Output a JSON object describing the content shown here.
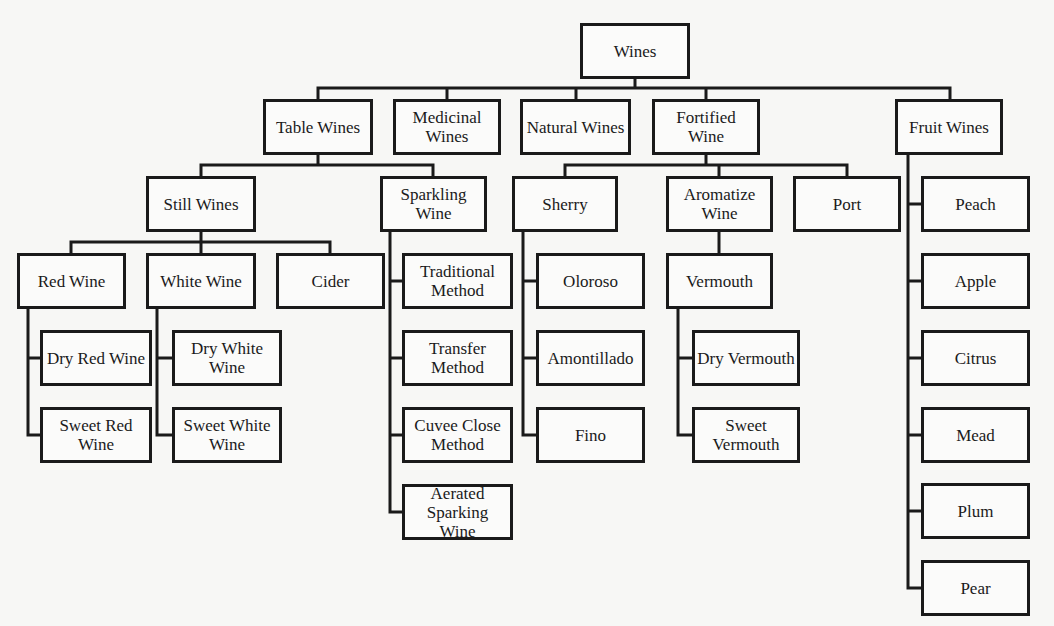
{
  "diagram": {
    "title": "Wines",
    "nodes": {
      "wines": {
        "label": "Wines",
        "x": 580,
        "y": 23,
        "w": 110,
        "h": 56
      },
      "table_wines": {
        "label": "Table Wines",
        "x": 263,
        "y": 99,
        "w": 110,
        "h": 56
      },
      "medicinal_wines": {
        "label": "Medicinal\nWines",
        "x": 393,
        "y": 99,
        "w": 108,
        "h": 56
      },
      "natural_wines": {
        "label": "Natural Wines",
        "x": 520,
        "y": 99,
        "w": 111,
        "h": 56
      },
      "fortified_wine": {
        "label": "Fortified\nWine",
        "x": 652,
        "y": 99,
        "w": 108,
        "h": 56
      },
      "fruit_wines": {
        "label": "Fruit Wines",
        "x": 895,
        "y": 99,
        "w": 108,
        "h": 56
      },
      "still_wines": {
        "label": "Still Wines",
        "x": 146,
        "y": 176,
        "w": 110,
        "h": 56
      },
      "sparkling_wine": {
        "label": "Sparkling\nWine",
        "x": 380,
        "y": 176,
        "w": 107,
        "h": 56
      },
      "sherry": {
        "label": "Sherry",
        "x": 512,
        "y": 176,
        "w": 106,
        "h": 56
      },
      "aromatize_wine": {
        "label": "Aromatize\nWine",
        "x": 666,
        "y": 176,
        "w": 107,
        "h": 56
      },
      "port": {
        "label": "Port",
        "x": 793,
        "y": 176,
        "w": 108,
        "h": 56
      },
      "peach": {
        "label": "Peach",
        "x": 921,
        "y": 176,
        "w": 109,
        "h": 56
      },
      "red_wine": {
        "label": "Red Wine",
        "x": 17,
        "y": 253,
        "w": 109,
        "h": 56
      },
      "white_wine": {
        "label": "White Wine",
        "x": 146,
        "y": 253,
        "w": 110,
        "h": 56
      },
      "cider": {
        "label": "Cider",
        "x": 276,
        "y": 253,
        "w": 109,
        "h": 56
      },
      "traditional_method": {
        "label": "Traditional\nMethod",
        "x": 402,
        "y": 253,
        "w": 111,
        "h": 56
      },
      "oloroso": {
        "label": "Oloroso",
        "x": 536,
        "y": 253,
        "w": 109,
        "h": 56
      },
      "vermouth": {
        "label": "Vermouth",
        "x": 666,
        "y": 253,
        "w": 107,
        "h": 56
      },
      "apple": {
        "label": "Apple",
        "x": 921,
        "y": 253,
        "w": 109,
        "h": 56
      },
      "dry_red_wine": {
        "label": "Dry Red Wine",
        "x": 40,
        "y": 330,
        "w": 112,
        "h": 56
      },
      "dry_white_wine": {
        "label": "Dry White\nWine",
        "x": 172,
        "y": 330,
        "w": 110,
        "h": 56
      },
      "transfer_method": {
        "label": "Transfer\nMethod",
        "x": 402,
        "y": 330,
        "w": 111,
        "h": 56
      },
      "amontillado": {
        "label": "Amontillado",
        "x": 536,
        "y": 330,
        "w": 109,
        "h": 56
      },
      "dry_vermouth": {
        "label": "Dry Vermouth",
        "x": 692,
        "y": 330,
        "w": 108,
        "h": 56
      },
      "citrus": {
        "label": "Citrus",
        "x": 921,
        "y": 330,
        "w": 109,
        "h": 56
      },
      "sweet_red_wine": {
        "label": "Sweet Red\nWine",
        "x": 40,
        "y": 407,
        "w": 112,
        "h": 56
      },
      "sweet_white_wine": {
        "label": "Sweet White\nWine",
        "x": 172,
        "y": 407,
        "w": 110,
        "h": 56
      },
      "cuvee_close_method": {
        "label": "Cuvee Close\nMethod",
        "x": 402,
        "y": 407,
        "w": 111,
        "h": 56
      },
      "fino": {
        "label": "Fino",
        "x": 536,
        "y": 407,
        "w": 109,
        "h": 56
      },
      "sweet_vermouth": {
        "label": "Sweet\nVermouth",
        "x": 692,
        "y": 407,
        "w": 108,
        "h": 56
      },
      "mead": {
        "label": "Mead",
        "x": 921,
        "y": 407,
        "w": 109,
        "h": 56
      },
      "aerated_sparking_wine": {
        "label": "Aerated\nSparking Wine",
        "x": 402,
        "y": 484,
        "w": 111,
        "h": 56
      },
      "plum": {
        "label": "Plum",
        "x": 921,
        "y": 483,
        "w": 109,
        "h": 56
      },
      "pear": {
        "label": "Pear",
        "x": 921,
        "y": 560,
        "w": 109,
        "h": 56
      }
    },
    "edges": [
      [
        "wines",
        "table_wines"
      ],
      [
        "wines",
        "medicinal_wines"
      ],
      [
        "wines",
        "natural_wines"
      ],
      [
        "wines",
        "fortified_wine"
      ],
      [
        "wines",
        "fruit_wines"
      ],
      [
        "table_wines",
        "still_wines"
      ],
      [
        "table_wines",
        "sparkling_wine"
      ],
      [
        "still_wines",
        "red_wine"
      ],
      [
        "still_wines",
        "white_wine"
      ],
      [
        "still_wines",
        "cider"
      ],
      [
        "red_wine",
        "dry_red_wine"
      ],
      [
        "red_wine",
        "sweet_red_wine"
      ],
      [
        "white_wine",
        "dry_white_wine"
      ],
      [
        "white_wine",
        "sweet_white_wine"
      ],
      [
        "sparkling_wine",
        "traditional_method"
      ],
      [
        "sparkling_wine",
        "transfer_method"
      ],
      [
        "sparkling_wine",
        "cuvee_close_method"
      ],
      [
        "sparkling_wine",
        "aerated_sparking_wine"
      ],
      [
        "fortified_wine",
        "sherry"
      ],
      [
        "fortified_wine",
        "aromatize_wine"
      ],
      [
        "fortified_wine",
        "port"
      ],
      [
        "sherry",
        "oloroso"
      ],
      [
        "sherry",
        "amontillado"
      ],
      [
        "sherry",
        "fino"
      ],
      [
        "aromatize_wine",
        "vermouth"
      ],
      [
        "vermouth",
        "dry_vermouth"
      ],
      [
        "vermouth",
        "sweet_vermouth"
      ],
      [
        "fruit_wines",
        "peach"
      ],
      [
        "fruit_wines",
        "apple"
      ],
      [
        "fruit_wines",
        "citrus"
      ],
      [
        "fruit_wines",
        "mead"
      ],
      [
        "fruit_wines",
        "plum"
      ],
      [
        "fruit_wines",
        "pear"
      ]
    ]
  }
}
